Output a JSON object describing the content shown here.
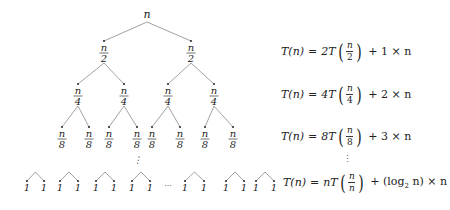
{
  "tree": {
    "root": {
      "label": "n",
      "x": 147,
      "y": 18
    },
    "levels": [
      {
        "numerator": "n",
        "denominator": "2",
        "xs": [
          104,
          191
        ],
        "y": 53,
        "parents": [
          147,
          147
        ],
        "parent_y": 22
      },
      {
        "numerator": "n",
        "denominator": "4",
        "xs": [
          78,
          124,
          168,
          214
        ],
        "y": 96,
        "parents": [
          104,
          104,
          191,
          191
        ],
        "parent_y": 63
      },
      {
        "numerator": "n",
        "denominator": "8",
        "xs": [
          62,
          89,
          109,
          137,
          152,
          180,
          205,
          233
        ],
        "y": 139,
        "parents": [
          78,
          78,
          124,
          124,
          168,
          168,
          214,
          214
        ],
        "parent_y": 106
      }
    ],
    "vertical_ellipsis": "⋮",
    "horizontal_ellipsis": "···",
    "leaf_label": "1",
    "leaf_pairs": [
      [
        27,
        44
      ],
      [
        60,
        78
      ],
      [
        96,
        114
      ],
      [
        132,
        150
      ],
      [
        185,
        204
      ],
      [
        226,
        244
      ],
      [
        256,
        274
      ]
    ]
  },
  "equations": [
    {
      "lhs": "T(n)",
      "eq": "=",
      "coef": "2T",
      "num": "n",
      "den": "2",
      "rest": "+ 1 × n"
    },
    {
      "lhs": "T(n)",
      "eq": "=",
      "coef": "4T",
      "num": "n",
      "den": "4",
      "rest": "+ 2 × n"
    },
    {
      "lhs": "T(n)",
      "eq": "=",
      "coef": "8T",
      "num": "n",
      "den": "8",
      "rest": "+ 3 × n"
    },
    {
      "lhs": "T(n)",
      "eq": "=",
      "coef": "nT",
      "num": "n",
      "den": "n",
      "rest_pre": "+ (log",
      "rest_sub": "2",
      "rest_post": " n) × n"
    }
  ],
  "equations_vdots": "⋮"
}
